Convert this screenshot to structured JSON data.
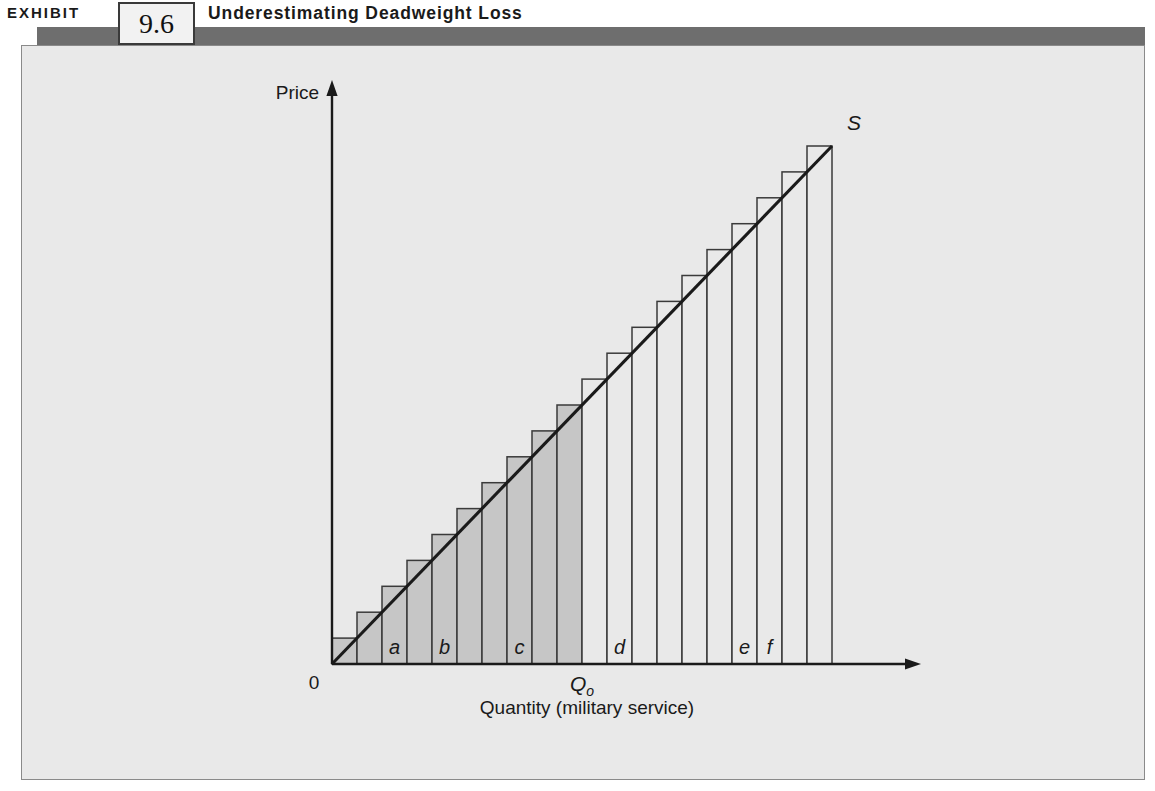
{
  "header": {
    "exhibit_word": "EXHIBIT",
    "exhibit_number": "9.6",
    "title": "Underestimating Deadweight Loss",
    "banner_color": "#6e6e6e"
  },
  "figure": {
    "background_color": "#e9e9e9",
    "border_color": "#8a8a8a"
  },
  "chart_data": {
    "type": "bar",
    "title": "Underestimating Deadweight Loss",
    "xlabel": "Quantity (military service)",
    "ylabel": "Price",
    "origin_label": "0",
    "quantity_marker": "Q",
    "quantity_marker_sub": "o",
    "curve_label": "S",
    "grid": false,
    "legend": "none",
    "xlim": [
      0,
      20
    ],
    "ylim": [
      0,
      20
    ],
    "categories": [
      1,
      2,
      3,
      4,
      5,
      6,
      7,
      8,
      9,
      10,
      11,
      12,
      13,
      14,
      15,
      16,
      17,
      18,
      19,
      20
    ],
    "values": [
      1,
      2,
      3,
      4,
      5,
      6,
      7,
      8,
      9,
      10,
      11,
      12,
      13,
      14,
      15,
      16,
      17,
      18,
      19,
      20
    ],
    "shaded_through_index": 10,
    "shaded_fill": "#c6c6c6",
    "unshaded_fill": "#e9e9e9",
    "bar_stroke": "#3a3a3a",
    "curve_color": "#1a1a1a",
    "q0_at_category": 10,
    "bar_labels": [
      {
        "category": 3,
        "label": "a"
      },
      {
        "category": 5,
        "label": "b"
      },
      {
        "category": 8,
        "label": "c"
      },
      {
        "category": 12,
        "label": "d"
      },
      {
        "category": 17,
        "label": "e"
      },
      {
        "category": 18,
        "label": "f"
      }
    ]
  }
}
